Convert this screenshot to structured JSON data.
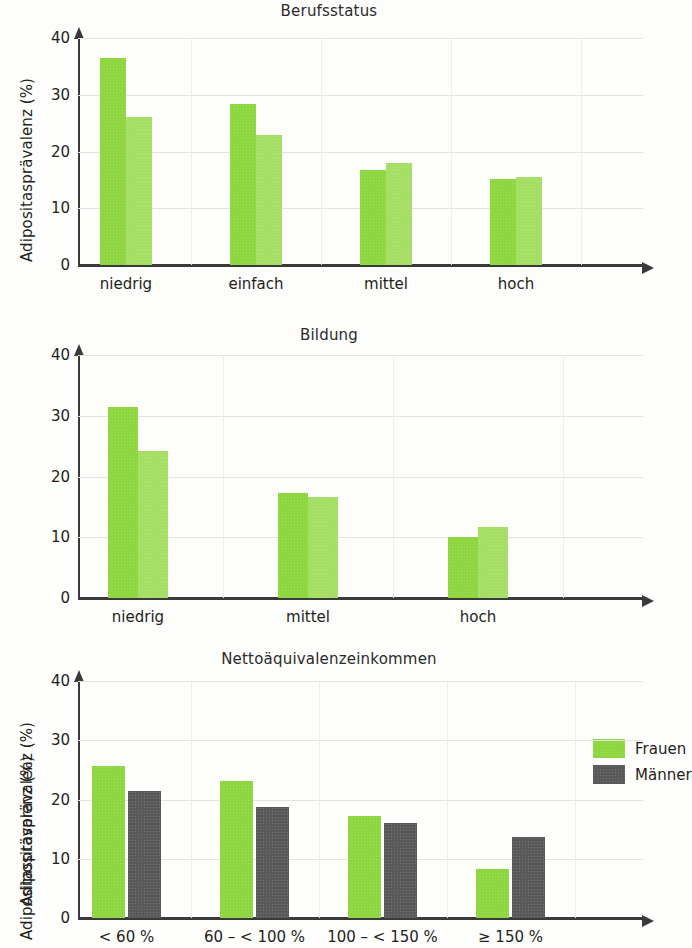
{
  "figure": {
    "ylabel": "Adipositasprävalenz (%)",
    "yticks": [
      "40",
      "30",
      "20",
      "10",
      "0"
    ],
    "legend": {
      "items": [
        {
          "label": "Frauen",
          "color": "#8ed63f",
          "swatch": "green"
        },
        {
          "label": "Männer",
          "color": "#595959",
          "swatch": "gray"
        }
      ]
    }
  },
  "chart_data": [
    {
      "type": "bar",
      "title": "Berufsstatus",
      "xlabel": "",
      "ylabel": "Adipositasprävalenz (%)",
      "ylim": [
        0,
        40
      ],
      "yticks": [
        0,
        10,
        20,
        30,
        40
      ],
      "grid": true,
      "legend_position": "none",
      "categories": [
        "niedrig",
        "einfach",
        "mittel",
        "hoch"
      ],
      "series": [
        {
          "name": "Frauen",
          "color": "#8ed63f",
          "values": [
            36.5,
            28.4,
            16.7,
            15.1
          ]
        },
        {
          "name": "Männer",
          "color": "#a4de63",
          "values": [
            26.1,
            22.9,
            17.9,
            15.5
          ]
        }
      ]
    },
    {
      "type": "bar",
      "title": "Bildung",
      "xlabel": "",
      "ylabel": "Adipositasprävalenz (%)",
      "ylim": [
        0,
        40
      ],
      "yticks": [
        0,
        10,
        20,
        30,
        40
      ],
      "grid": true,
      "legend_position": "none",
      "categories": [
        "niedrig",
        "mittel",
        "hoch"
      ],
      "series": [
        {
          "name": "Frauen",
          "color": "#8ed63f",
          "values": [
            31.5,
            17.3,
            10.0
          ]
        },
        {
          "name": "Männer",
          "color": "#a4de63",
          "values": [
            24.2,
            16.6,
            11.7
          ]
        }
      ]
    },
    {
      "type": "bar",
      "title": "Nettoäquivalenzeinkommen",
      "xlabel": "",
      "ylabel": "Adipositasprävalenz (%)",
      "ylim": [
        0,
        40
      ],
      "yticks": [
        0,
        10,
        20,
        30,
        40
      ],
      "grid": true,
      "legend_position": "top-right",
      "categories": [
        "< 60 %",
        "60 – < 100 %",
        "100 – < 150 %",
        "≥ 150 %"
      ],
      "series": [
        {
          "name": "Frauen",
          "color": "#8ed63f",
          "values": [
            25.6,
            23.2,
            17.2,
            8.3
          ]
        },
        {
          "name": "Männer",
          "color": "#595959",
          "values": [
            21.4,
            18.7,
            16.1,
            13.6
          ]
        }
      ]
    }
  ]
}
